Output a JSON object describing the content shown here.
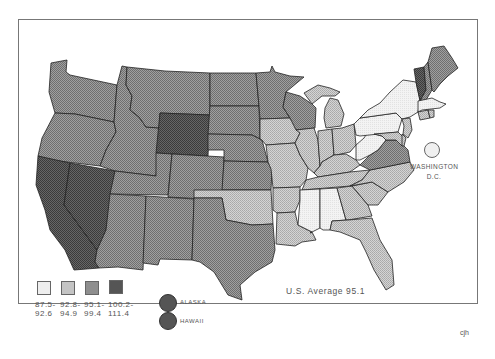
{
  "map": {
    "title": "",
    "average_label": "U.S. Average 95.1",
    "credit": "cjh",
    "colors": {
      "c1": "#eeeeee",
      "c2": "#c4c4c4",
      "c3": "#8e8e8e",
      "c4": "#555555"
    },
    "legend": [
      {
        "range_top": "87.5-",
        "range_bottom": "92.6",
        "color": "#eeeeee"
      },
      {
        "range_top": "92.8-",
        "range_bottom": "94.9",
        "color": "#c4c4c4"
      },
      {
        "range_top": "95.1-",
        "range_bottom": "99.4",
        "color": "#8e8e8e"
      },
      {
        "range_top": "100.2-",
        "range_bottom": "111.4",
        "color": "#555555"
      }
    ],
    "insets": [
      {
        "label": "ALASKA",
        "category": "100.2-111.4"
      },
      {
        "label": "HAWAII",
        "category": "100.2-111.4"
      }
    ],
    "dc": {
      "label_line1": "WASHINGTON",
      "label_line2": "D.C.",
      "category": "87.5-92.6"
    },
    "states": {
      "WA": "95.1-99.4",
      "OR": "95.1-99.4",
      "CA": "100.2-111.4",
      "NV": "100.2-111.4",
      "ID": "95.1-99.4",
      "MT": "95.1-99.4",
      "WY": "100.2-111.4",
      "UT": "95.1-99.4",
      "AZ": "95.1-99.4",
      "CO": "95.1-99.4",
      "NM": "95.1-99.4",
      "TX": "95.1-99.4",
      "ND": "95.1-99.4",
      "SD": "95.1-99.4",
      "NE": "95.1-99.4",
      "KS": "95.1-99.4",
      "OK": "92.8-94.9",
      "MN": "95.1-99.4",
      "IA": "92.8-94.9",
      "MO": "92.8-94.9",
      "AR": "92.8-94.9",
      "LA": "92.8-94.9",
      "WI": "95.1-99.4",
      "IL": "92.8-94.9",
      "MI": "92.8-94.9",
      "IN": "92.8-94.9",
      "OH": "92.8-94.9",
      "KY": "92.8-94.9",
      "TN": "92.8-94.9",
      "MS": "87.5-92.6",
      "AL": "87.5-92.6",
      "GA": "92.8-94.9",
      "FL": "92.8-94.9",
      "SC": "92.8-94.9",
      "NC": "92.8-94.9",
      "VA": "95.1-99.4",
      "WV": "87.5-92.6",
      "PA": "87.5-92.6",
      "NY": "87.5-92.6",
      "VT": "100.2-111.4",
      "NH": "95.1-99.4",
      "ME": "95.1-99.4",
      "MA": "87.5-92.6",
      "CT": "92.8-94.9",
      "RI": "92.8-94.9",
      "NJ": "92.8-94.9",
      "DE": "92.8-94.9",
      "MD": "92.8-94.9"
    }
  }
}
